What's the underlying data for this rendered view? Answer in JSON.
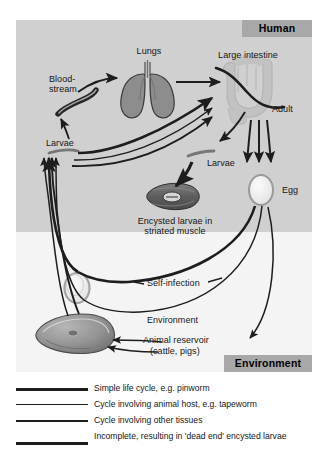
{
  "figure": {
    "zones": [
      {
        "name": "human",
        "label": "Human"
      },
      {
        "name": "environment",
        "label": "Environment"
      }
    ],
    "colors": {
      "human_panel": "#d0d0d0",
      "environment_panel": "#f4f4f4",
      "zone_tag": "#a8a8a8",
      "organ_fill": "#8d8d8d",
      "intestine_fill": "#c2c2c2",
      "line": "#1d1d1d",
      "text": "#161616"
    },
    "labels": [
      {
        "name": "lungs",
        "text": "Lungs"
      },
      {
        "name": "large-intestine",
        "text": "Large intestine"
      },
      {
        "name": "bloodstream",
        "text": "Blood-\nstream"
      },
      {
        "name": "adult",
        "text": "Adult"
      },
      {
        "name": "larvae-left",
        "text": "Larvae"
      },
      {
        "name": "larvae-center",
        "text": "Larvae"
      },
      {
        "name": "egg",
        "text": "Egg"
      },
      {
        "name": "encysted-larvae",
        "text": "Encysted larvae in\nstriated muscle"
      },
      {
        "name": "self-infection",
        "text": "Self-infection"
      },
      {
        "name": "environment-route",
        "text": "Environment"
      },
      {
        "name": "animal-reservoir",
        "text": "Animal reservoir\n(cattle, pigs)"
      }
    ],
    "label_text": {
      "lungs": "Lungs",
      "large_intestine": "Large intestine",
      "bloodstream_line1": "Blood-",
      "bloodstream_line2": "stream",
      "adult": "Adult",
      "larvae_left": "Larvae",
      "larvae_center": "Larvae",
      "egg": "Egg",
      "encysted_line1": "Encysted larvae in",
      "encysted_line2": "striated muscle",
      "self_infection": "Self-infection",
      "environment_route": "Environment",
      "animal_line1": "Animal reservoir",
      "animal_line2": "(cattle, pigs)"
    },
    "organs": [
      {
        "name": "lungs-icon",
        "description": "pair of lungs with trachea"
      },
      {
        "name": "large-intestine-icon",
        "description": "colon loop"
      },
      {
        "name": "adult-worm-icon",
        "description": "long sigmoid adult worm across intestine"
      },
      {
        "name": "bloodstream-icon",
        "description": "curved blood vessel segment"
      },
      {
        "name": "encysted-larva-icon",
        "description": "striated muscle fibre with encysted larva"
      },
      {
        "name": "egg-human-icon",
        "description": "egg oval in human zone"
      },
      {
        "name": "egg-environment-icon",
        "description": "egg oval in environment zone"
      },
      {
        "name": "animal-reservoir-icon",
        "description": "cut of meat representing cattle and pigs"
      },
      {
        "name": "larva-left-icon",
        "description": "small larva crescent"
      },
      {
        "name": "larva-center-icon",
        "description": "small larva crescent"
      }
    ]
  },
  "legend": {
    "items": [
      {
        "name": "legend-simple-life-cycle",
        "text": "Simple life cycle, e.g. pinworm",
        "weight": 2.6
      },
      {
        "name": "legend-animal-host",
        "text": "Cycle involving animal host, e.g. tapeworm",
        "weight": 1.5
      },
      {
        "name": "legend-other-tissues",
        "text": "Cycle involving other tissues",
        "weight": 1.9
      },
      {
        "name": "legend-incomplete",
        "text": "Incomplete, resulting in 'dead end' encysted larvae",
        "weight": 3.2
      }
    ],
    "rows": {
      "r0": "Simple life cycle, e.g. pinworm",
      "r1": "Cycle involving animal host, e.g. tapeworm",
      "r2": "Cycle involving other tissues",
      "r3": "Incomplete, resulting in 'dead end' encysted larvae"
    }
  }
}
